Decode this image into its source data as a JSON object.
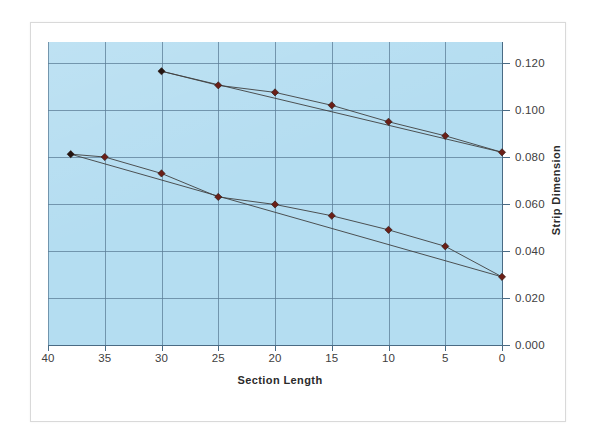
{
  "chart_data": {
    "type": "line",
    "title": "",
    "xlabel": "Section Length",
    "ylabel": "Strip Dimension",
    "x_ticks": [
      40,
      35,
      30,
      25,
      20,
      15,
      10,
      5,
      0
    ],
    "x_tick_labels": [
      "40",
      "35",
      "30",
      "25",
      "20",
      "15",
      "10",
      "5",
      "0"
    ],
    "y_ticks": [
      0.0,
      0.02,
      0.04,
      0.06,
      0.08,
      0.1,
      0.12
    ],
    "y_tick_labels": [
      "0.000",
      "0.020",
      "0.040",
      "0.060",
      "0.080",
      "0.100",
      "0.120"
    ],
    "xlim": [
      40,
      0
    ],
    "ylim": [
      0.0,
      0.128
    ],
    "x_axis_reversed": true,
    "grid": true,
    "legend": "none",
    "plot_background_color": "#b4ddf1",
    "gridline_color": "#5b7c95",
    "marker_color": "#6b1f17",
    "line_color": "#3f3f3f",
    "series": [
      {
        "name": "upper-series",
        "marker": "diamond",
        "points": [
          {
            "x": 30,
            "y": 0.1165
          },
          {
            "x": 25,
            "y": 0.1105
          },
          {
            "x": 20,
            "y": 0.1075
          },
          {
            "x": 15,
            "y": 0.102
          },
          {
            "x": 10,
            "y": 0.095
          },
          {
            "x": 5,
            "y": 0.089
          },
          {
            "x": 0,
            "y": 0.082
          }
        ],
        "trendline": [
          {
            "x": 30,
            "y": 0.1165
          },
          {
            "x": 0,
            "y": 0.082
          }
        ]
      },
      {
        "name": "lower-series",
        "marker": "diamond",
        "points": [
          {
            "x": 38,
            "y": 0.0812
          },
          {
            "x": 35,
            "y": 0.08
          },
          {
            "x": 30,
            "y": 0.073
          },
          {
            "x": 25,
            "y": 0.063
          },
          {
            "x": 20,
            "y": 0.0598
          },
          {
            "x": 15,
            "y": 0.055
          },
          {
            "x": 10,
            "y": 0.049
          },
          {
            "x": 5,
            "y": 0.042
          },
          {
            "x": 0,
            "y": 0.029
          }
        ],
        "trendline": [
          {
            "x": 38,
            "y": 0.0812
          },
          {
            "x": 0,
            "y": 0.029
          }
        ]
      }
    ]
  }
}
